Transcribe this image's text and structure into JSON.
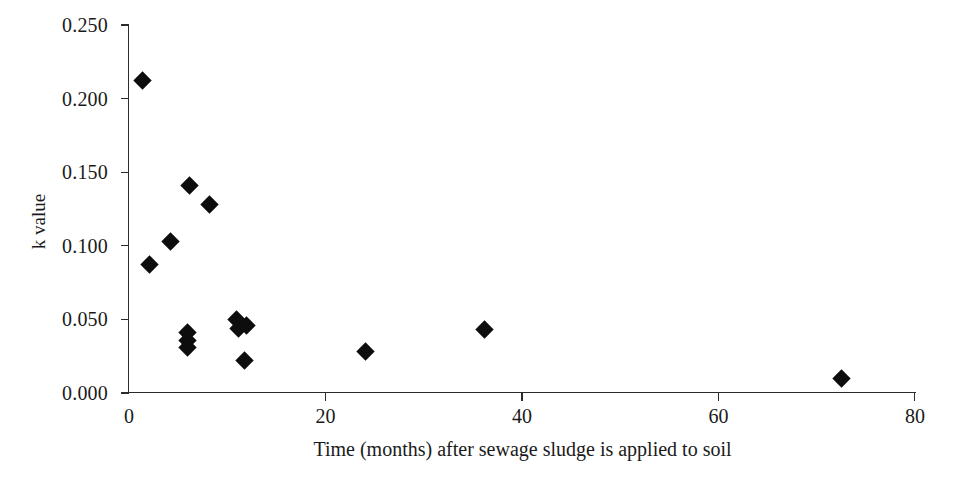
{
  "chart_data": {
    "type": "scatter",
    "title": "",
    "xlabel": "Time (months) after sewage sludge is applied to soil",
    "ylabel": "k value",
    "xlim": [
      0,
      80
    ],
    "ylim": [
      0.0,
      0.25
    ],
    "xticks": [
      0,
      20,
      40,
      60,
      80
    ],
    "xtick_labels": [
      "0",
      "20",
      "40",
      "60",
      "80"
    ],
    "yticks": [
      0.0,
      0.05,
      0.1,
      0.15,
      0.2,
      0.25
    ],
    "ytick_labels": [
      "0.000",
      "0.050",
      "0.100",
      "0.150",
      "0.200",
      "0.250"
    ],
    "grid": false,
    "legend": null,
    "marker": "diamond",
    "marker_color": "#0d0d0d",
    "points": [
      {
        "x": 1.4,
        "y": 0.212
      },
      {
        "x": 2.1,
        "y": 0.087
      },
      {
        "x": 4.2,
        "y": 0.103
      },
      {
        "x": 6.2,
        "y": 0.141
      },
      {
        "x": 8.2,
        "y": 0.128
      },
      {
        "x": 6.0,
        "y": 0.041
      },
      {
        "x": 6.0,
        "y": 0.036
      },
      {
        "x": 6.0,
        "y": 0.031
      },
      {
        "x": 10.9,
        "y": 0.05
      },
      {
        "x": 11.1,
        "y": 0.044
      },
      {
        "x": 12.0,
        "y": 0.046
      },
      {
        "x": 11.8,
        "y": 0.022
      },
      {
        "x": 24.1,
        "y": 0.028
      },
      {
        "x": 36.2,
        "y": 0.043
      },
      {
        "x": 72.5,
        "y": 0.01
      }
    ]
  },
  "axes": {
    "x_title": "Time (months) after sewage sludge is applied to soil",
    "y_title": "k value"
  }
}
